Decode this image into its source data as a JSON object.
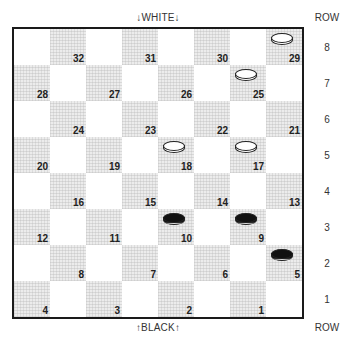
{
  "labels": {
    "top": "↓WHITE↓",
    "bottom": "↑BLACK↑",
    "row_header_top": "ROW",
    "row_header_bottom": "ROW"
  },
  "row_numbers": [
    "8",
    "7",
    "6",
    "5",
    "4",
    "3",
    "2",
    "1"
  ],
  "squares": [
    {
      "num": "32",
      "row": 0,
      "col": 1
    },
    {
      "num": "31",
      "row": 0,
      "col": 3
    },
    {
      "num": "30",
      "row": 0,
      "col": 5
    },
    {
      "num": "29",
      "row": 0,
      "col": 7
    },
    {
      "num": "28",
      "row": 1,
      "col": 0
    },
    {
      "num": "27",
      "row": 1,
      "col": 2
    },
    {
      "num": "26",
      "row": 1,
      "col": 4
    },
    {
      "num": "25",
      "row": 1,
      "col": 6
    },
    {
      "num": "24",
      "row": 2,
      "col": 1
    },
    {
      "num": "23",
      "row": 2,
      "col": 3
    },
    {
      "num": "22",
      "row": 2,
      "col": 5
    },
    {
      "num": "21",
      "row": 2,
      "col": 7
    },
    {
      "num": "20",
      "row": 3,
      "col": 0
    },
    {
      "num": "19",
      "row": 3,
      "col": 2
    },
    {
      "num": "18",
      "row": 3,
      "col": 4
    },
    {
      "num": "17",
      "row": 3,
      "col": 6
    },
    {
      "num": "16",
      "row": 4,
      "col": 1
    },
    {
      "num": "15",
      "row": 4,
      "col": 3
    },
    {
      "num": "14",
      "row": 4,
      "col": 5
    },
    {
      "num": "13",
      "row": 4,
      "col": 7
    },
    {
      "num": "12",
      "row": 5,
      "col": 0
    },
    {
      "num": "11",
      "row": 5,
      "col": 2
    },
    {
      "num": "10",
      "row": 5,
      "col": 4
    },
    {
      "num": "9",
      "row": 5,
      "col": 6
    },
    {
      "num": "8",
      "row": 6,
      "col": 1
    },
    {
      "num": "7",
      "row": 6,
      "col": 3
    },
    {
      "num": "6",
      "row": 6,
      "col": 5
    },
    {
      "num": "5",
      "row": 6,
      "col": 7
    },
    {
      "num": "4",
      "row": 7,
      "col": 0
    },
    {
      "num": "3",
      "row": 7,
      "col": 2
    },
    {
      "num": "2",
      "row": 7,
      "col": 4
    },
    {
      "num": "1",
      "row": 7,
      "col": 6
    }
  ],
  "pieces": [
    {
      "square": "29",
      "color": "white"
    },
    {
      "square": "25",
      "color": "white"
    },
    {
      "square": "18",
      "color": "white"
    },
    {
      "square": "17",
      "color": "white"
    },
    {
      "square": "10",
      "color": "black"
    },
    {
      "square": "9",
      "color": "black"
    },
    {
      "square": "5",
      "color": "black"
    }
  ]
}
